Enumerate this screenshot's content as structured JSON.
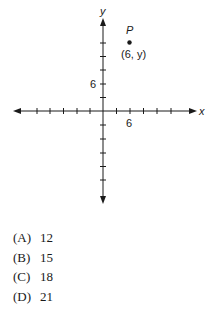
{
  "figure": {
    "x_axis_label": "x",
    "y_axis_label": "y",
    "x_tick_label": "6",
    "y_tick_label": "6",
    "point_name": "P",
    "point_coords": "(6, y)"
  },
  "choices": [
    {
      "letter": "(A)",
      "value": "12"
    },
    {
      "letter": "(B)",
      "value": "15"
    },
    {
      "letter": "(C)",
      "value": "18"
    },
    {
      "letter": "(D)",
      "value": "21"
    }
  ]
}
